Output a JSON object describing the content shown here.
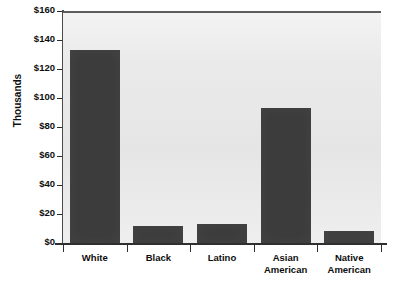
{
  "chart_data": {
    "type": "bar",
    "title": "",
    "subtitle": "",
    "xlabel": "",
    "ylabel": "Thousands",
    "categories": [
      "White",
      "Black",
      "Latino",
      "Asian American",
      "Native American"
    ],
    "category_lines": [
      [
        "White"
      ],
      [
        "Black"
      ],
      [
        "Latino"
      ],
      [
        "Asian",
        "American"
      ],
      [
        "Native",
        "American"
      ]
    ],
    "values": [
      133,
      12,
      13,
      93,
      8
    ],
    "value_prefix": "$",
    "value_unit": "thousands",
    "ylim": [
      0,
      160
    ],
    "ytick_step": 20,
    "ytick_labels": [
      "$0",
      "$20",
      "$40",
      "$60",
      "$80",
      "$100",
      "$120",
      "$140",
      "$160"
    ],
    "ytick_values": [
      0,
      20,
      40,
      60,
      80,
      100,
      120,
      140,
      160
    ],
    "grid": false,
    "legend": false,
    "legend_position": "none",
    "bar_color": "#3c3c3c",
    "plot_background_color": "#e9e9e9",
    "axis_color": "#2f2f2f",
    "text_color": "#0d0d0d",
    "page_background_color": "#ffffff"
  }
}
